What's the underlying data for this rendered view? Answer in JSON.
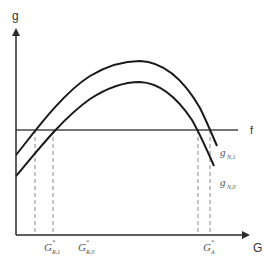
{
  "diagram": {
    "axes": {
      "y_label": "g",
      "x_label": "G",
      "origin": [
        16,
        235
      ],
      "y_top": 28,
      "x_right": 250
    },
    "threshold_line": {
      "label": "f",
      "y": 130,
      "x_start": 16,
      "x_end": 238
    },
    "curves": [
      {
        "name": "g_N,1",
        "label_main": "g",
        "label_sub": "N,1",
        "path": "M16,155 C30,138 60,95 90,76 C110,64 125,61 140,61 C165,62 185,82 200,108 C206,120 211,132 217,146"
      },
      {
        "name": "g_N,0",
        "label_main": "g",
        "label_sub": "N,0",
        "path": "M16,176 C30,160 60,120 90,99 C110,86 125,82 140,82 C162,83 180,102 192,120 C200,134 207,150 214,166"
      }
    ],
    "dashed_lines": [
      {
        "x": 35,
        "y_top": 130
      },
      {
        "x": 53,
        "y_top": 130
      },
      {
        "x": 198,
        "y_top": 130
      },
      {
        "x": 210,
        "y_top": 130
      }
    ],
    "x_tick_labels": [
      {
        "main": "G",
        "sup": "*",
        "sub": "R,1",
        "x": 44
      },
      {
        "main": "G",
        "sup": "*",
        "sub": "R,0",
        "x": 78
      },
      {
        "main": "G",
        "sup": "*",
        "sub": "A",
        "x": 202
      }
    ],
    "colors": {
      "curve": "#1a1a1a",
      "axis": "#2a2a2a",
      "f_line": "#4a4a4a",
      "dashed": "#8a8a8a",
      "label": "#555555"
    }
  }
}
